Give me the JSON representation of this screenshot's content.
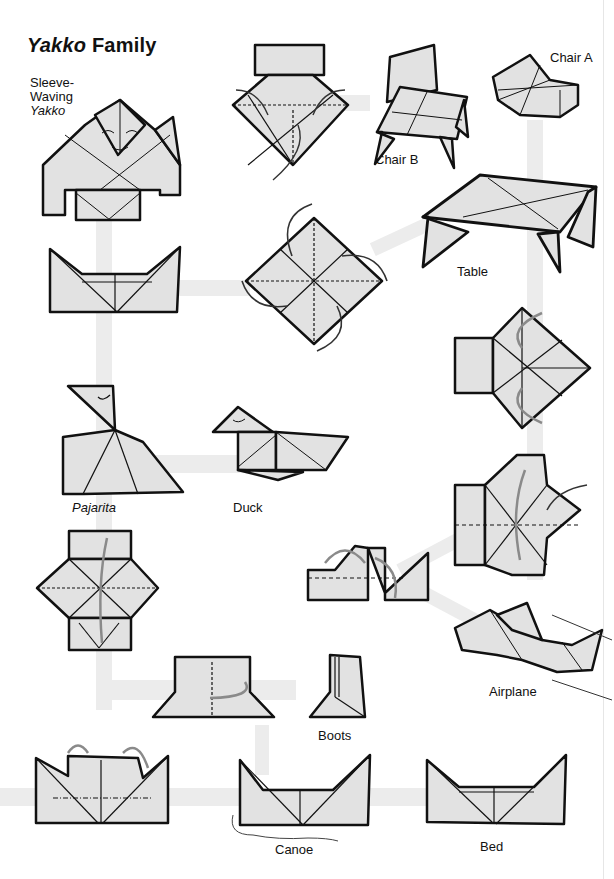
{
  "title": {
    "italic": "Yakko",
    "rest": " Family"
  },
  "labels": [
    {
      "id": "sleeve-waving-yakko",
      "lines": [
        "Sleeve-",
        "Waving"
      ],
      "italic_line": "Yakko",
      "x": 30,
      "y": 76
    },
    {
      "id": "chair-a",
      "text": "Chair A",
      "x": 550,
      "y": 51,
      "italic": false
    },
    {
      "id": "chair-b",
      "text": "Chair B",
      "x": 375,
      "y": 153,
      "italic": false
    },
    {
      "id": "table",
      "text": "Table",
      "x": 457,
      "y": 265,
      "italic": false
    },
    {
      "id": "pajarita",
      "text": "Pajarita",
      "x": 72,
      "y": 501,
      "italic": true
    },
    {
      "id": "duck",
      "text": "Duck",
      "x": 233,
      "y": 501,
      "italic": false
    },
    {
      "id": "airplane",
      "text": "Airplane",
      "x": 489,
      "y": 685,
      "italic": false
    },
    {
      "id": "boots",
      "text": "Boots",
      "x": 318,
      "y": 729,
      "italic": false
    },
    {
      "id": "canoe",
      "text": "Canoe",
      "x": 275,
      "y": 843,
      "italic": false
    },
    {
      "id": "bed",
      "text": "Bed",
      "x": 480,
      "y": 840,
      "italic": false
    }
  ],
  "figures": [
    "sleeve-waving-yakko",
    "yakko-base-open",
    "chair-b",
    "chair-a",
    "table",
    "pinwheel-base",
    "boat-yakko",
    "pajarita",
    "duck",
    "square-base-right",
    "airplane-step",
    "chair-step",
    "airplane",
    "yakko-step-left",
    "boots-step",
    "boots",
    "boat-step",
    "canoe",
    "bed"
  ],
  "colors": {
    "paper": "#e2e2e2",
    "line": "#111111",
    "band": "#ececec",
    "arrow_gray": "#8a8a8a"
  }
}
